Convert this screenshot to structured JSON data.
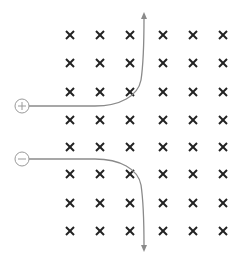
{
  "diagram": {
    "field": {
      "symbol": "×",
      "direction": "into-page",
      "columns_x": [
        70,
        100,
        130,
        163,
        193,
        223
      ],
      "rows_y": [
        35,
        63,
        92,
        120,
        147,
        174,
        203,
        231
      ],
      "color": "#222222"
    },
    "particles": [
      {
        "charge": "positive",
        "symbol": "+",
        "center": [
          22,
          106
        ],
        "path_color": "#888888",
        "deflection": "up"
      },
      {
        "charge": "negative",
        "symbol": "−",
        "center": [
          22,
          159
        ],
        "path_color": "#888888",
        "deflection": "down"
      }
    ]
  }
}
